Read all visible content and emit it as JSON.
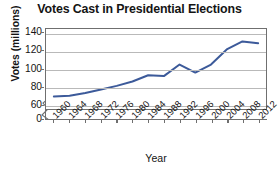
{
  "chart_data": {
    "type": "line",
    "title": "Votes Cast in Presidential Elections",
    "xlabel": "Year",
    "ylabel": "Votes (millions)",
    "x": [
      1960,
      1964,
      1968,
      1972,
      1976,
      1980,
      1984,
      1988,
      1992,
      1996,
      2000,
      2004,
      2008,
      2012
    ],
    "xtick_labels": [
      "1960",
      "1964",
      "1968",
      "1972",
      "1976",
      "1980",
      "1984",
      "1988",
      "1992",
      "1996",
      "2000",
      "2004",
      "2008",
      "2012"
    ],
    "values": [
      69,
      70,
      73,
      77,
      81,
      86,
      93,
      92,
      105,
      96,
      105,
      122,
      131,
      129
    ],
    "series": [
      {
        "name": "Votes Cast",
        "color": "#3c5a9a",
        "values": [
          69,
          70,
          73,
          77,
          81,
          86,
          93,
          92,
          105,
          96,
          105,
          122,
          131,
          129
        ]
      }
    ],
    "ytick_labels": [
      "140",
      "120",
      "100",
      "80",
      "60",
      "0"
    ],
    "ytick_values": [
      140,
      120,
      100,
      80,
      60,
      0
    ],
    "ylim": [
      55,
      145
    ],
    "xlim": [
      1958,
      2014
    ],
    "y_axis_break": true,
    "y_axis_break_between": [
      0,
      60
    ],
    "grid": "horizontal",
    "gridlines_at": [
      140,
      120,
      100,
      80,
      60
    ],
    "legend": "none",
    "marker": "none",
    "line_width": 2
  },
  "colors": {
    "line": "#3c5a9a",
    "grid": "#b9b9b9",
    "frame": "#6f6f6f",
    "text": "#141414",
    "background": "#ffffff"
  }
}
